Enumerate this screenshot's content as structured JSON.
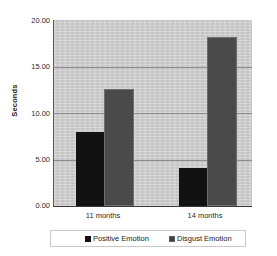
{
  "chart_data": {
    "type": "bar",
    "title": "",
    "xlabel": "",
    "ylabel": "Seconds",
    "categories": [
      "11 months",
      "14 months"
    ],
    "series": [
      {
        "name": "Positive Emotion",
        "values": [
          8.0,
          4.1
        ],
        "fill": "solid",
        "color": "#121212"
      },
      {
        "name": "Disgust Emotion",
        "values": [
          12.6,
          18.2
        ],
        "fill": "hatched",
        "color": "#b9b9b9"
      }
    ],
    "ylim": [
      0,
      20
    ],
    "yticks": [
      0,
      5,
      10,
      15,
      20
    ],
    "ytick_labels": [
      "0.00",
      "5.00",
      "10.00",
      "15.00",
      "20.00"
    ],
    "grid": true,
    "legend_position": "bottom",
    "plot_background": "#cfcfcf",
    "figure_background": "#ffffff"
  },
  "legend": {
    "entries": [
      {
        "label": "Positive Emotion"
      },
      {
        "label": "Disgust Emotion"
      }
    ]
  },
  "axes": {
    "y_title": "Seconds",
    "y_labels": [
      "20.00",
      "15.00",
      "10.00",
      "5.00",
      "0.00"
    ],
    "x_labels": [
      "11 months",
      "14 months"
    ]
  }
}
